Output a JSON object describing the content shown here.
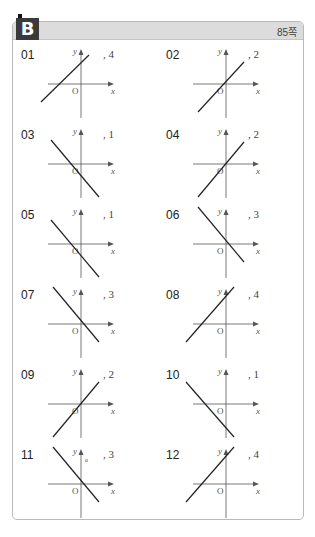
{
  "header": {
    "section_badge": "B",
    "page_ref": "85쪽"
  },
  "colors": {
    "header_bg": "#dcdcdc",
    "badge_bg": "#3a3a3a",
    "line": "#222222",
    "axis": "#555555"
  },
  "axis_labels": {
    "x": "x",
    "y": "y",
    "origin": "O"
  },
  "problems": [
    {
      "num": "01",
      "answer": ", 4",
      "line": [
        [
          8,
          60
        ],
        [
          56,
          13
        ]
      ]
    },
    {
      "num": "02",
      "answer": ", 2",
      "line": [
        [
          20,
          70
        ],
        [
          66,
          20
        ]
      ]
    },
    {
      "num": "03",
      "answer": ", 1",
      "line": [
        [
          18,
          18
        ],
        [
          66,
          75
        ]
      ]
    },
    {
      "num": "04",
      "answer": ", 2",
      "line": [
        [
          20,
          75
        ],
        [
          66,
          20
        ]
      ]
    },
    {
      "num": "05",
      "answer": ", 1",
      "line": [
        [
          18,
          18
        ],
        [
          66,
          75
        ]
      ]
    },
    {
      "num": "06",
      "answer": ", 3",
      "line": [
        [
          20,
          5
        ],
        [
          66,
          60
        ]
      ]
    },
    {
      "num": "07",
      "answer": ", 3",
      "line": [
        [
          20,
          5
        ],
        [
          66,
          60
        ]
      ]
    },
    {
      "num": "08",
      "answer": ", 4",
      "line": [
        [
          8,
          60
        ],
        [
          56,
          5
        ]
      ]
    },
    {
      "num": "09",
      "answer": ", 2",
      "line": [
        [
          20,
          75
        ],
        [
          66,
          20
        ]
      ]
    },
    {
      "num": "10",
      "answer": ", 1",
      "line": [
        [
          8,
          20
        ],
        [
          56,
          75
        ]
      ]
    },
    {
      "num": "11",
      "answer": ", 3",
      "line": [
        [
          20,
          5
        ],
        [
          66,
          60
        ]
      ],
      "extra_label": "a"
    },
    {
      "num": "12",
      "answer": ", 4",
      "line": [
        [
          8,
          60
        ],
        [
          56,
          5
        ]
      ]
    }
  ]
}
